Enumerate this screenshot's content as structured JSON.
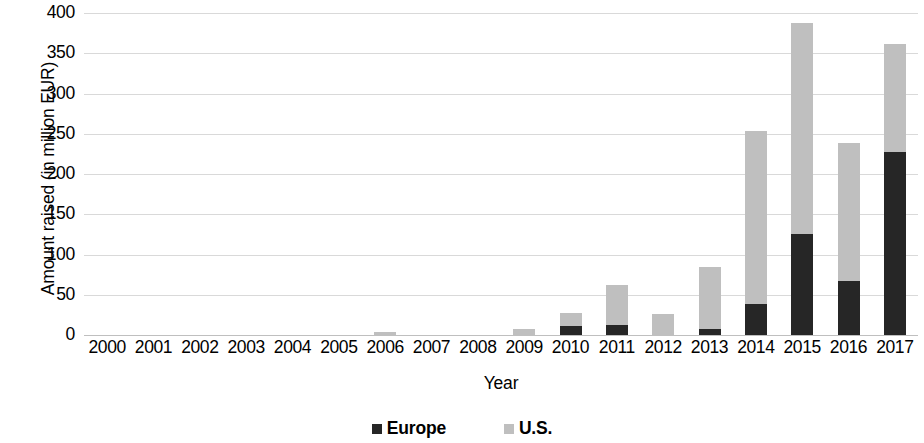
{
  "chart_data": {
    "type": "bar",
    "subtype": "stacked-vertical",
    "title": "",
    "xlabel": "Year",
    "ylabel": "Amount raised (in million EUR)",
    "ylim": [
      0,
      400
    ],
    "yticks": [
      0,
      50,
      100,
      150,
      200,
      250,
      300,
      350,
      400
    ],
    "ytick_labels": [
      "0",
      "50",
      "100",
      "150",
      "200",
      "250",
      "300",
      "350",
      "400"
    ],
    "grid": true,
    "grid_axis": "y",
    "legend_position": "bottom",
    "categories": [
      "2000",
      "2001",
      "2002",
      "2003",
      "2004",
      "2005",
      "2006",
      "2007",
      "2008",
      "2009",
      "2010",
      "2011",
      "2012",
      "2013",
      "2014",
      "2015",
      "2016",
      "2017"
    ],
    "series": [
      {
        "name": "Europe",
        "color": "#262626",
        "values": [
          0,
          0,
          0,
          0,
          0,
          0,
          0,
          0,
          0,
          0,
          11,
          12,
          0,
          8,
          39,
          126,
          67,
          227
        ]
      },
      {
        "name": "U.S.",
        "color": "#bfbfbf",
        "values": [
          0,
          0,
          0,
          0,
          0,
          0,
          4,
          0,
          0,
          7,
          16,
          50,
          26,
          77,
          215,
          261,
          172,
          135
        ]
      }
    ],
    "totals": [
      0,
      0,
      0,
      0,
      0,
      0,
      4,
      0,
      0,
      7,
      27,
      62,
      26,
      85,
      254,
      387,
      239,
      362
    ]
  },
  "legend": {
    "items": [
      {
        "label": "Europe",
        "swatch": "legend-swatch-europe"
      },
      {
        "label": "U.S.",
        "swatch": "legend-swatch-us"
      }
    ]
  },
  "colors": {
    "europe": "#262626",
    "us": "#bfbfbf",
    "gridline": "#d9d9d9",
    "axis": "#bfbfbf",
    "background": "#ffffff",
    "text": "#000000"
  }
}
